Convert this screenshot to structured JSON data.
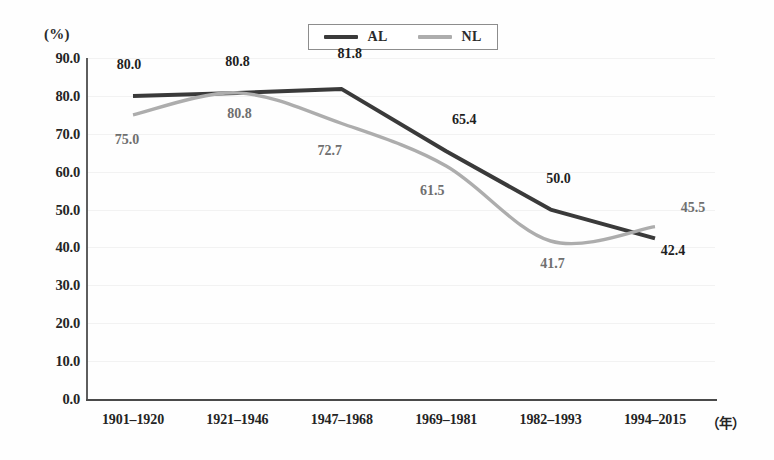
{
  "chart_data": {
    "type": "line",
    "title": "",
    "subtitle": "",
    "xlabel": "（年）",
    "ylabel": "(%)",
    "ylim": [
      0.0,
      90.0
    ],
    "ytick_step": 10.0,
    "grid": true,
    "legend_position": "top-center",
    "categories": [
      "1901–1920",
      "1921–1946",
      "1947–1968",
      "1969–1981",
      "1982–1993",
      "1994–2015"
    ],
    "yticks": [
      "90.0",
      "80.0",
      "70.0",
      "60.0",
      "50.0",
      "40.0",
      "30.0",
      "20.0",
      "10.0",
      "0.0"
    ],
    "ytick_values": [
      90.0,
      80.0,
      70.0,
      60.0,
      50.0,
      40.0,
      30.0,
      20.0,
      10.0,
      0.0
    ],
    "series": [
      {
        "name": "AL",
        "color": "#3a3a3a",
        "values": [
          80.0,
          80.8,
          81.8,
          65.4,
          50.0,
          42.4
        ],
        "labels": [
          "80.0",
          "80.8",
          "81.8",
          "65.4",
          "50.0",
          "42.4"
        ]
      },
      {
        "name": "NL",
        "color": "#adadad",
        "values": [
          75.0,
          80.8,
          72.7,
          61.5,
          41.7,
          45.5
        ],
        "labels": [
          "75.0",
          "80.8",
          "72.7",
          "61.5",
          "41.7",
          "45.5"
        ]
      }
    ]
  },
  "legend": {
    "items": [
      {
        "label": "AL",
        "color": "#3a3a3a"
      },
      {
        "label": "NL",
        "color": "#adadad"
      }
    ]
  },
  "axes": {
    "y_unit": "(%)",
    "x_unit": "（年）"
  },
  "colors": {
    "series_al": "#3a3a3a",
    "series_nl": "#adadad",
    "axis": "#4a4a4a",
    "grid": "#f2f2f2",
    "text": "#242424",
    "background": "#fefefe"
  }
}
